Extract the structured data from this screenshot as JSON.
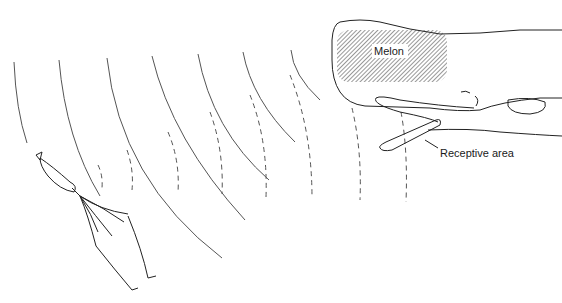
{
  "diagram": {
    "labels": {
      "melon": "Melon",
      "receptive_area": "Receptive area"
    },
    "elements": {
      "whale": "sperm-whale-head",
      "squid": "squid",
      "outgoing_waves": "solid-arcs",
      "returning_echoes": "dashed-arcs"
    },
    "colors": {
      "ink": "#222222",
      "wave": "#555555",
      "background": "#ffffff"
    }
  }
}
